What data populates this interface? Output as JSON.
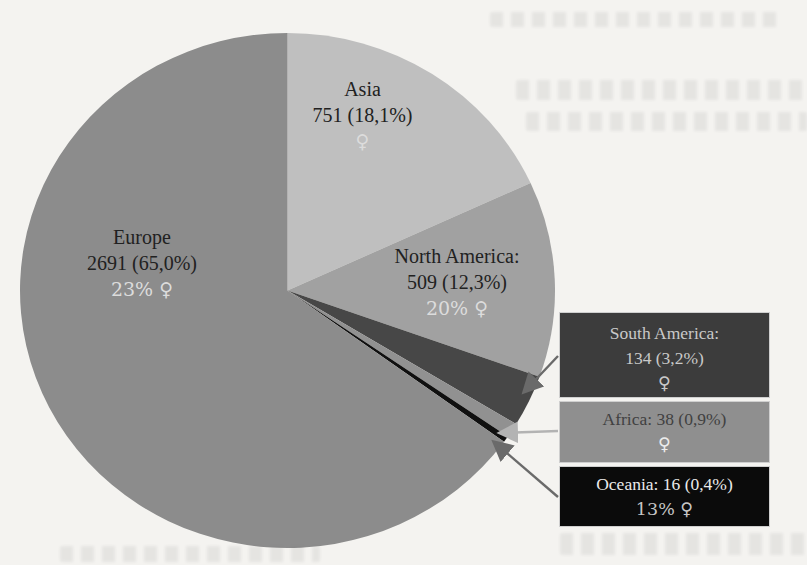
{
  "figure": {
    "description_note": "Scanned book page: pie chart of participants by continent with counts, percentages and female-share labels"
  },
  "colors": {
    "page_bg": "#f4f3f0",
    "text_dark": "#212121",
    "text_light": "#dcdcdc",
    "sa_box_bg": "#3c3c3c",
    "sa_box_text": "#c9c9c9",
    "af_box_bg": "#8f8f8f",
    "af_box_text": "#414141",
    "af_box_female": "#ececec",
    "oc_box_bg": "#0b0b0b",
    "oc_box_text": "#eaeaea",
    "oc_box_subtext": "#c6c6c6",
    "arrow_dark": "#6a6a6a",
    "arrow_light": "#b3b3b3"
  },
  "chart_data": {
    "type": "pie",
    "title": "",
    "legend_position": "right (callout boxes for small slices)",
    "start": "12 o'clock, clockwise",
    "slices": [
      {
        "label": "Asia",
        "value": 751,
        "percent": 18.1,
        "display": "751 (18,1%)",
        "female_share": "♀",
        "color": "#bfbfbf"
      },
      {
        "label": "North America",
        "value": 509,
        "percent": 12.3,
        "display": "509 (12,3%)",
        "female_share": "20% ♀",
        "color": "#a1a1a1"
      },
      {
        "label": "South America",
        "value": 134,
        "percent": 3.2,
        "display": "134 (3,2%)",
        "female_share": "♀",
        "color": "#474747"
      },
      {
        "label": "Africa",
        "value": 38,
        "percent": 0.9,
        "display": "38 (0,9%)",
        "female_share": "♀",
        "color": "#919191"
      },
      {
        "label": "Oceania",
        "value": 16,
        "percent": 0.4,
        "display": "16 (0,4%)",
        "female_share": "13% ♀",
        "color": "#101010"
      },
      {
        "label": "Europe",
        "value": 2691,
        "percent": 65.0,
        "display": "2691 (65,0%)",
        "female_share": "23% ♀",
        "color": "#8c8c8c"
      }
    ]
  },
  "pie_labels": {
    "asia": {
      "name": "Asia",
      "value": "751 (18,1%)",
      "female": "♀"
    },
    "europe": {
      "name": "Europe",
      "value": "2691 (65,0%)",
      "female": "23% ♀"
    },
    "north_america": {
      "name": "North America:",
      "value": "509 (12,3%)",
      "female": "20% ♀"
    }
  },
  "legend": {
    "south_america": {
      "line1": "South America:",
      "line2": "134 (3,2%)",
      "female": "♀"
    },
    "africa": {
      "line1": "Africa: 38 (0,9%)",
      "female": "♀"
    },
    "oceania": {
      "line1": "Oceania: 16 (0,4%)",
      "female": "13% ♀"
    }
  }
}
